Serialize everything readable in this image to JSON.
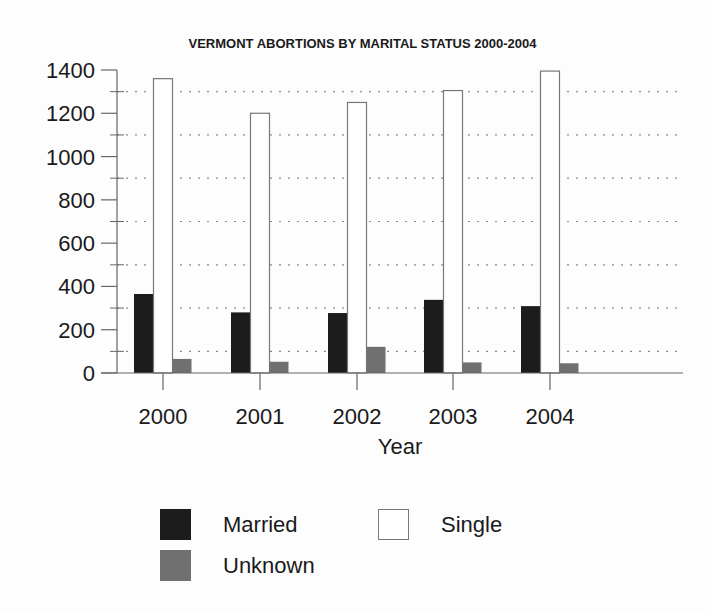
{
  "chart_data": {
    "type": "bar",
    "title": "VERMONT ABORTIONS BY MARITAL STATUS 2000-2004",
    "xlabel": "Year",
    "ylabel": "",
    "categories": [
      "2000",
      "2001",
      "2002",
      "2003",
      "2004"
    ],
    "series": [
      {
        "name": "Married",
        "color": "#1c1c1c",
        "values": [
          365,
          280,
          277,
          338,
          309
        ]
      },
      {
        "name": "Single",
        "color": "#ffffff",
        "values": [
          1360,
          1200,
          1250,
          1305,
          1395
        ]
      },
      {
        "name": "Unknown",
        "color": "#707070",
        "values": [
          65,
          52,
          121,
          49,
          45
        ]
      }
    ],
    "ylim": [
      0,
      1400
    ],
    "yticks": [
      0,
      200,
      400,
      600,
      800,
      1000,
      1200,
      1400
    ],
    "grid": {
      "on": true,
      "style": "dotted",
      "at": [
        100,
        300,
        500,
        700,
        900,
        1100,
        1300
      ]
    },
    "legend": {
      "position": "bottom",
      "entries": [
        "Married",
        "Single",
        "Unknown"
      ]
    }
  },
  "header": {
    "title": "VERMONT ABORTIONS BY MARITAL STATUS 2000-2004"
  },
  "axes": {
    "x_label": "Year",
    "x_ticks": [
      "2000",
      "2001",
      "2002",
      "2003",
      "2004"
    ],
    "y_ticks": [
      "0",
      "200",
      "400",
      "600",
      "800",
      "1000",
      "1200",
      "1400"
    ]
  },
  "legend": {
    "items": [
      {
        "label": "Married",
        "color": "#1c1c1c"
      },
      {
        "label": "Single",
        "color": "#ffffff"
      },
      {
        "label": "Unknown",
        "color": "#707070"
      }
    ]
  }
}
